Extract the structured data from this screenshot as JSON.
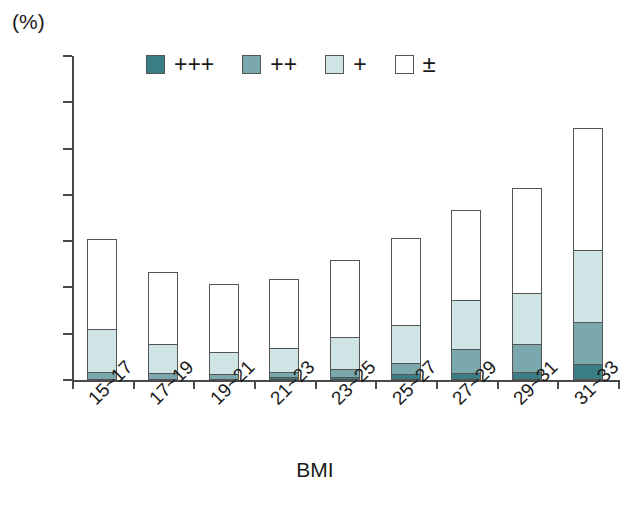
{
  "chart_data": {
    "type": "bar",
    "stacked": true,
    "title": "",
    "xlabel": "BMI",
    "ylabel": "(%)",
    "unit_label": "(%)",
    "ylim": [
      0,
      35
    ],
    "yticks": [
      0,
      5,
      10,
      15,
      20,
      25,
      30,
      35
    ],
    "ytick_labels": [
      "0",
      "5",
      "10",
      "15",
      "20",
      "25",
      "30",
      "35"
    ],
    "grid": false,
    "legend_position": "top-center",
    "categories": [
      "15~17",
      "17~19",
      "19~21",
      "21~23",
      "23~25",
      "25~27",
      "27~29",
      "29~31",
      "31~33"
    ],
    "series": [
      {
        "name": "+++",
        "label": "+++",
        "color": "#3b7d85",
        "values": [
          0.0,
          0.0,
          0.0,
          0.2,
          0.2,
          0.5,
          0.7,
          0.8,
          1.6
        ]
      },
      {
        "name": "++",
        "label": "++",
        "color": "#7ba8ac",
        "values": [
          0.8,
          0.7,
          0.5,
          0.6,
          0.9,
          1.2,
          2.5,
          3.0,
          4.6
        ]
      },
      {
        "name": "+",
        "label": "+",
        "color": "#cfe4e4",
        "values": [
          4.6,
          3.1,
          2.4,
          2.6,
          3.4,
          4.1,
          5.3,
          5.5,
          7.7
        ]
      },
      {
        "name": "±",
        "label": "±",
        "color": "#ffffff",
        "values": [
          9.8,
          7.9,
          7.5,
          7.5,
          8.5,
          9.5,
          9.9,
          11.4,
          13.3
        ]
      }
    ],
    "totals": [
      15.2,
      11.7,
      10.4,
      10.9,
      13.0,
      15.3,
      18.4,
      20.7,
      27.2
    ],
    "segment_tops": [
      [
        0.0,
        0.8,
        5.4,
        15.2
      ],
      [
        0.0,
        0.7,
        3.8,
        11.7
      ],
      [
        0.0,
        0.5,
        2.9,
        10.4
      ],
      [
        0.2,
        0.8,
        3.4,
        10.9
      ],
      [
        0.2,
        1.1,
        4.5,
        13.0
      ],
      [
        0.5,
        1.7,
        5.8,
        15.3
      ],
      [
        0.7,
        3.2,
        8.5,
        18.4
      ],
      [
        0.8,
        3.8,
        9.3,
        20.7
      ],
      [
        1.6,
        6.2,
        13.9,
        27.2
      ]
    ]
  },
  "axis": {
    "unit": "(%)",
    "x_title": "BMI"
  },
  "legend": {
    "items": [
      {
        "label": "+++",
        "color": "#3b7d85"
      },
      {
        "label": "++",
        "color": "#7ba8ac"
      },
      {
        "label": "+",
        "color": "#cfe4e4"
      },
      {
        "label": "±",
        "color": "#ffffff"
      }
    ]
  },
  "colors": {
    "axis": "#4a4a4a",
    "outline": "#555555",
    "plus3": "#3b7d85",
    "plus2": "#7ba8ac",
    "plus1": "#cfe4e4",
    "pm": "#ffffff",
    "background": "#ffffff"
  },
  "caption": {
    "text": ""
  }
}
